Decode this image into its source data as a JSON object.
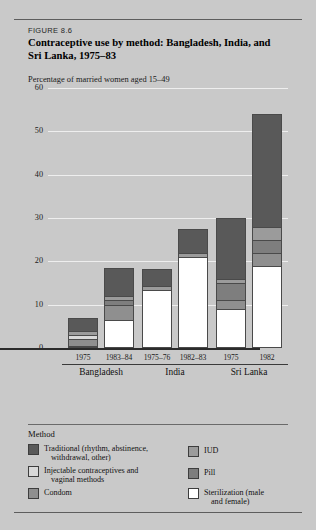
{
  "figure": {
    "number_label": "FIGURE 8.6",
    "title": "Contraceptive use by method: Bangladesh, India, and Sri Lanka, 1975–83",
    "axis_caption": "Percentage of married women aged 15–49"
  },
  "legend": {
    "heading": "Method",
    "items": [
      {
        "label": "Traditional (rhythm, abstinence,",
        "label2": "withdrawal, other)",
        "color": "#595959",
        "key": "traditional"
      },
      {
        "label": "Injectable contraceptives and",
        "label2": "vaginal methods",
        "color": "#d8d8d8",
        "key": "injectable"
      },
      {
        "label": "Condom",
        "label2": "",
        "color": "#8f8f8f",
        "key": "condom"
      },
      {
        "label": "IUD",
        "label2": "",
        "color": "#9b9b9b",
        "key": "iud"
      },
      {
        "label": "Pill",
        "label2": "",
        "color": "#7e7e7e",
        "key": "pill"
      },
      {
        "label": "Sterilization (male",
        "label2": "and female)",
        "color": "#ffffff",
        "key": "sterilization"
      }
    ]
  },
  "chart_data": {
    "type": "bar",
    "subtype": "stacked",
    "title": "Contraceptive use by method: Bangladesh, India, and Sri Lanka, 1975–83",
    "xlabel": "",
    "ylabel": "Percentage of married women aged 15–49",
    "ylim": [
      0,
      60
    ],
    "yticks": [
      0,
      10,
      20,
      30,
      40,
      50,
      60
    ],
    "grid": true,
    "legend_position": "bottom",
    "groups": [
      {
        "name": "Bangladesh",
        "categories": [
          "1975",
          "1983–84"
        ]
      },
      {
        "name": "India",
        "categories": [
          "1975–76",
          "1982–83"
        ]
      },
      {
        "name": "Sri Lanka",
        "categories": [
          "1975",
          "1982"
        ]
      }
    ],
    "categories": [
      "1975",
      "1983–84",
      "1975–76",
      "1982–83",
      "1975",
      "1982"
    ],
    "series": [
      {
        "name": "Sterilization (male and female)",
        "color": "#ffffff",
        "values": [
          0.5,
          6.5,
          13.5,
          21.0,
          9.0,
          19.0
        ]
      },
      {
        "name": "Condom",
        "color": "#8f8f8f",
        "values": [
          1.5,
          3.5,
          0.0,
          0.0,
          2.0,
          3.0
        ]
      },
      {
        "name": "Injectable contraceptives and vaginal methods",
        "color": "#d8d8d8",
        "values": [
          1.0,
          0.0,
          0.0,
          0.0,
          0.0,
          0.0
        ]
      },
      {
        "name": "Pill",
        "color": "#7e7e7e",
        "values": [
          0.0,
          1.0,
          0.0,
          0.0,
          4.0,
          3.0
        ]
      },
      {
        "name": "IUD",
        "color": "#9b9b9b",
        "values": [
          1.0,
          1.0,
          0.7,
          1.0,
          1.0,
          3.0
        ]
      },
      {
        "name": "Traditional (rhythm, abstinence, withdrawal, other)",
        "color": "#595959",
        "values": [
          3.0,
          6.5,
          4.0,
          5.5,
          14.0,
          26.0
        ]
      }
    ],
    "totals": [
      7.0,
      18.5,
      18.2,
      27.5,
      30.0,
      54.0
    ]
  }
}
